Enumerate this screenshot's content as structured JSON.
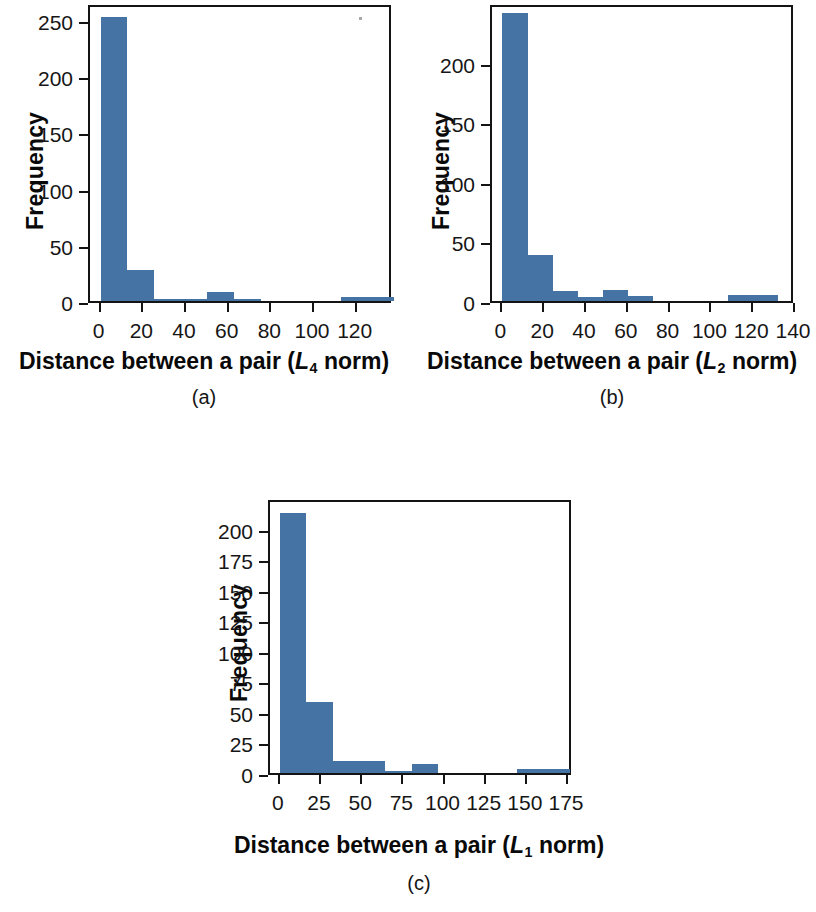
{
  "figure": {
    "background_color": "#ffffff",
    "bar_color": "#4573a3",
    "axis_color": "#141414"
  },
  "panels": [
    {
      "id": "a",
      "caption": "(a)",
      "ylabel": "Frequency",
      "xlabel_prefix": "Distance between a pair (",
      "xlabel_norm_symbol": "L",
      "xlabel_norm_sub": "4",
      "xlabel_suffix": " norm)",
      "yticks": [
        "0",
        "50",
        "100",
        "150",
        "200",
        "250"
      ],
      "xticks": [
        "0",
        "20",
        "40",
        "60",
        "80",
        "100",
        "120"
      ]
    },
    {
      "id": "b",
      "caption": "(b)",
      "ylabel": "Frequency",
      "xlabel_prefix": "Distance between a pair (",
      "xlabel_norm_symbol": "L",
      "xlabel_norm_sub": "2",
      "xlabel_suffix": " norm)",
      "yticks": [
        "0",
        "50",
        "100",
        "150",
        "200"
      ],
      "xticks": [
        "0",
        "20",
        "40",
        "60",
        "80",
        "100",
        "120",
        "140"
      ]
    },
    {
      "id": "c",
      "caption": "(c)",
      "ylabel": "Frequency",
      "xlabel_prefix": "Distance between a pair (",
      "xlabel_norm_symbol": "L",
      "xlabel_norm_sub": "1",
      "xlabel_suffix": " norm)",
      "yticks": [
        "0",
        "25",
        "50",
        "75",
        "100",
        "125",
        "150",
        "175",
        "200"
      ],
      "xticks": [
        "0",
        "25",
        "50",
        "75",
        "100",
        "125",
        "150",
        "175"
      ]
    }
  ],
  "chart_data": [
    {
      "type": "bar",
      "panel": "a",
      "title": "",
      "xlabel": "Distance between a pair (L4 norm)",
      "ylabel": "Frequency",
      "xlim": [
        -5,
        137
      ],
      "ylim": [
        0,
        265
      ],
      "grid": false,
      "legend": null,
      "bin_width": 12.5,
      "bin_edges": [
        0,
        12.5,
        25,
        37.5,
        50,
        62.5,
        75,
        87.5,
        100,
        112.5,
        125,
        137.5
      ],
      "categories": [
        "0-12.5",
        "12.5-25",
        "25-37.5",
        "37.5-50",
        "50-62.5",
        "62.5-75",
        "75-87.5",
        "87.5-100",
        "100-112.5",
        "112.5-125",
        "125-137.5"
      ],
      "values": [
        253,
        28,
        1,
        1,
        8,
        2,
        0,
        0,
        0,
        4,
        4
      ],
      "ytick_values": [
        0,
        50,
        100,
        150,
        200,
        250
      ],
      "xtick_values": [
        0,
        20,
        40,
        60,
        80,
        100,
        120
      ]
    },
    {
      "type": "bar",
      "panel": "b",
      "title": "",
      "xlabel": "Distance between a pair (L2 norm)",
      "ylabel": "Frequency",
      "xlim": [
        -5,
        140
      ],
      "ylim": [
        0,
        250
      ],
      "grid": false,
      "legend": null,
      "bin_width": 12,
      "bin_edges": [
        0,
        12,
        24,
        36,
        48,
        60,
        72,
        84,
        96,
        108,
        120,
        132
      ],
      "categories": [
        "0-12",
        "12-24",
        "24-36",
        "36-48",
        "48-60",
        "60-72",
        "72-84",
        "84-96",
        "96-108",
        "108-120",
        "120-132"
      ],
      "values": [
        242,
        39,
        8,
        3,
        9,
        4,
        0,
        0,
        0,
        5,
        5
      ],
      "ytick_values": [
        0,
        50,
        100,
        150,
        200
      ],
      "xtick_values": [
        0,
        20,
        40,
        60,
        80,
        100,
        120,
        140
      ]
    },
    {
      "type": "bar",
      "panel": "c",
      "title": "",
      "xlabel": "Distance between a pair (L1 norm)",
      "ylabel": "Frequency",
      "xlim": [
        -6,
        178
      ],
      "ylim": [
        0,
        225
      ],
      "grid": false,
      "legend": null,
      "bin_width": 16,
      "bin_edges": [
        0,
        16,
        32,
        48,
        64,
        80,
        96,
        112,
        128,
        144,
        160,
        176
      ],
      "categories": [
        "0-16",
        "16-32",
        "32-48",
        "48-64",
        "64-80",
        "80-96",
        "96-112",
        "112-128",
        "128-144",
        "144-160",
        "160-176"
      ],
      "values": [
        213,
        58,
        10,
        10,
        2,
        7,
        0,
        0,
        0,
        3,
        3
      ],
      "ytick_values": [
        0,
        25,
        50,
        75,
        100,
        125,
        150,
        175,
        200
      ],
      "xtick_values": [
        0,
        25,
        50,
        75,
        100,
        125,
        150,
        175
      ]
    }
  ]
}
